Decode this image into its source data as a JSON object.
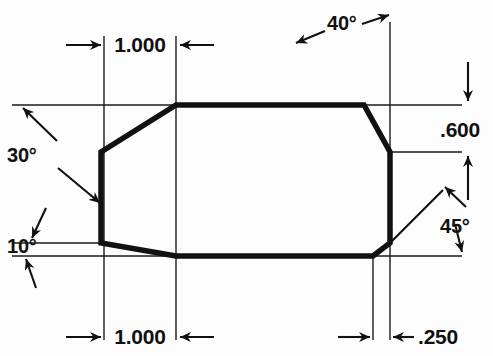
{
  "drawing": {
    "title": "Octagonal Profile Dimensioned Drawing",
    "type": "engineering-dimension-drawing",
    "canvas": {
      "width": 493,
      "height": 356,
      "background": "#fdfdfd"
    },
    "colors": {
      "object_line": "#111111",
      "thin_line": "#1a1a1a",
      "text": "#111111"
    },
    "line_weights": {
      "object": 5,
      "extension": 1.2,
      "leader": 2.2
    },
    "profile": {
      "name": "octagon-outline",
      "closed": true,
      "vertices": [
        {
          "id": "top-left",
          "x": 176,
          "y": 105
        },
        {
          "id": "top-right",
          "x": 364,
          "y": 105
        },
        {
          "id": "upper-right",
          "x": 390,
          "y": 152
        },
        {
          "id": "lower-right",
          "x": 390,
          "y": 243
        },
        {
          "id": "bottom-right",
          "x": 373,
          "y": 256
        },
        {
          "id": "bottom-left",
          "x": 176,
          "y": 256
        },
        {
          "id": "lower-left",
          "x": 101,
          "y": 243
        },
        {
          "id": "upper-left",
          "x": 101,
          "y": 152
        }
      ]
    },
    "extension_lines": {
      "horizontal": [
        {
          "id": "top-edge-ext",
          "y": 105,
          "x1": 12,
          "x2": 462
        },
        {
          "id": "upper-right-ext",
          "y": 152,
          "x1": 390,
          "x2": 462
        },
        {
          "id": "lower-left-ext",
          "y": 243,
          "x1": 12,
          "x2": 110
        },
        {
          "id": "bottom-edge-ext",
          "y": 256,
          "x1": 12,
          "x2": 462
        }
      ],
      "vertical": [
        {
          "id": "left-face-ext",
          "x": 104,
          "y1": 36,
          "y2": 340
        },
        {
          "id": "top-left-vertex-ext",
          "x": 176,
          "y1": 36,
          "y2": 340
        },
        {
          "id": "bottom-right-vertex-ext",
          "x": 373,
          "y1": 256,
          "y2": 340
        },
        {
          "id": "right-face-ext",
          "x": 390,
          "y1": 22,
          "y2": 340
        },
        {
          "id": "right-depth-ext",
          "x": 468,
          "y1": 60,
          "y2": 105
        }
      ]
    },
    "dimensions": [
      {
        "id": "width-top",
        "label": "1.000",
        "orientation": "horizontal",
        "value": 1.0,
        "unit": "in",
        "from_x": 104,
        "to_x": 176,
        "y": 45,
        "text_x": 140,
        "text_y": 52,
        "arrow_style": "outside"
      },
      {
        "id": "width-bottom",
        "label": "1.000",
        "orientation": "horizontal",
        "value": 1.0,
        "unit": "in",
        "from_x": 104,
        "to_x": 176,
        "y": 337,
        "text_x": 140,
        "text_y": 344,
        "arrow_style": "outside"
      },
      {
        "id": "chamfer-width-right",
        "label": ".250",
        "orientation": "horizontal",
        "value": 0.25,
        "unit": "in",
        "from_x": 373,
        "to_x": 390,
        "y": 337,
        "text_x": 420,
        "text_y": 344,
        "arrow_style": "outside"
      },
      {
        "id": "height-right",
        "label": ".600",
        "orientation": "vertical",
        "value": 0.6,
        "unit": "in",
        "from_y": 105,
        "to_y": 152,
        "x": 468,
        "text_x": 441,
        "text_y": 136,
        "arrow_style": "outside"
      }
    ],
    "angles": [
      {
        "id": "angle-upper-left",
        "label": "30°",
        "value": 30,
        "unit": "deg",
        "text_x": 8,
        "text_y": 160,
        "leader_to_reference": {
          "x1": 55,
          "y1": 140,
          "x2": 22,
          "y2": 107
        },
        "leader_to_feature": {
          "x1": 60,
          "y1": 168,
          "x2": 100,
          "y2": 200
        }
      },
      {
        "id": "angle-upper-right",
        "label": "40°",
        "value": 40,
        "unit": "deg",
        "text_x": 325,
        "text_y": 29,
        "leader_to_reference": {
          "x1": 375,
          "y1": 22,
          "x2": 389,
          "y2": 14
        },
        "leader_to_feature": {
          "x1": 322,
          "y1": 32,
          "x2": 296,
          "y2": 45
        }
      },
      {
        "id": "angle-lower-left",
        "label": "10°",
        "value": 10,
        "unit": "deg",
        "text_x": 8,
        "text_y": 252,
        "leader_to_reference": {
          "x1": 44,
          "y1": 226,
          "x2": 32,
          "y2": 240
        },
        "leader_to_feature": {
          "x1": 30,
          "y1": 288,
          "x2": 22,
          "y2": 260
        }
      },
      {
        "id": "angle-lower-right",
        "label": "45°",
        "value": 45,
        "unit": "deg",
        "text_x": 441,
        "text_y": 232,
        "leader_to_reference": {
          "x1": 437,
          "y1": 199,
          "x2": 446,
          "y2": 186
        },
        "leader_to_feature": {
          "x1": 452,
          "y1": 236,
          "x2": 459,
          "y2": 254
        }
      }
    ]
  }
}
